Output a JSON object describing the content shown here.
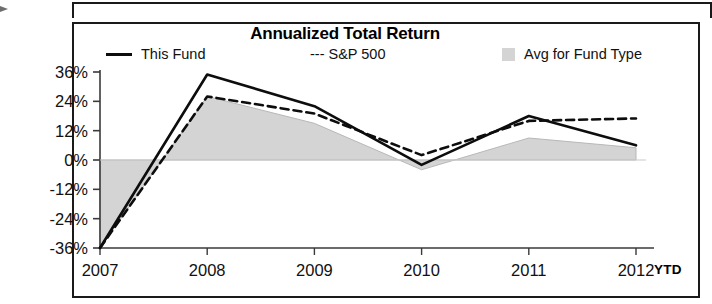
{
  "chart_data": {
    "type": "line",
    "title": "Annualized Total Return",
    "xlabel": "",
    "ylabel": "",
    "categories": [
      "2007",
      "2008",
      "2009",
      "2010",
      "2011",
      "2012"
    ],
    "x_tick_labels": [
      "2007",
      "2008",
      "2009",
      "2010",
      "2011",
      "2012"
    ],
    "x_axis_note": "YTD",
    "y_tick_labels": [
      "36%",
      "24%",
      "12%",
      "0%",
      "-12%",
      "-24%",
      "-36%"
    ],
    "y_tick_values": [
      36,
      24,
      12,
      0,
      -12,
      -24,
      -36
    ],
    "ylim": [
      -36,
      36
    ],
    "grid": false,
    "legend_position": "top",
    "series": [
      {
        "name": "This Fund",
        "style": "solid-line",
        "color": "#0d0d0d",
        "values": [
          -36,
          35,
          22,
          -2,
          18,
          6
        ]
      },
      {
        "name": "S&P 500",
        "style": "dashed-line",
        "color": "#0d0d0d",
        "values": [
          -36,
          26,
          19,
          2,
          16,
          17
        ]
      },
      {
        "name": "Avg for Fund Type",
        "style": "filled-area",
        "color": "#d4d4d4",
        "values": [
          -36,
          26,
          15,
          -4,
          9,
          5
        ]
      }
    ]
  },
  "legend": {
    "this_fund": "This Fund",
    "sp500": "--- S&P 500",
    "avg_fund_type": "Avg for Fund Type"
  },
  "axis": {
    "y_labels": [
      "36%",
      "24%",
      "12%",
      "0%",
      "-12%",
      "-24%",
      "-36%"
    ],
    "x_labels": [
      "2007",
      "2008",
      "2009",
      "2010",
      "2011",
      "2012"
    ],
    "ytd_label": "YTD"
  }
}
